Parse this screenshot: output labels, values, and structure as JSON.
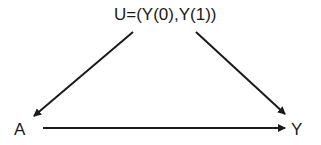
{
  "diagram": {
    "type": "causal-dag",
    "nodes": [
      {
        "id": "U",
        "label": "U=(Y(0),Y(1))"
      },
      {
        "id": "A",
        "label": "A"
      },
      {
        "id": "Y",
        "label": "Y"
      }
    ],
    "edges": [
      {
        "from": "U",
        "to": "A"
      },
      {
        "from": "U",
        "to": "Y"
      },
      {
        "from": "A",
        "to": "Y"
      }
    ],
    "colors": {
      "line": "#1a1a1a",
      "text": "#1a1a1a",
      "background": "#ffffff"
    }
  }
}
